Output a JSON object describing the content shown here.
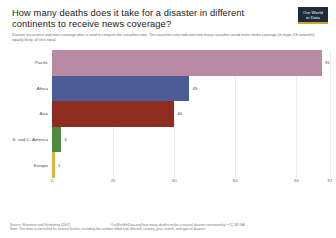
{
  "header": {
    "title": "How many deaths does it take for a disaster in different continents to receive news coverage?",
    "subtitle": "Disaster occurrence and news coverage data is used to compute the casualties ratio. The casualties ratio indicates how many casualties would make media coverage (in major US networks) equally likely, all else equal.",
    "logo_line1": "Our World",
    "logo_line2": "in Data"
  },
  "footer": {
    "source": "Source: Eisensee and Strömberg (2007)",
    "url": "OurWorldInData.org/how-many-deaths-make-a-natural-disaster-newsworthy/ • CC BY-SA",
    "note": "Note: This data is controlled for several factors, including the number killed and affected, country, year, month, and type of disaster."
  },
  "chart_data": {
    "type": "bar",
    "orientation": "horizontal",
    "title": "How many deaths does it take for a disaster in different continents to receive news coverage?",
    "xlabel": "",
    "ylabel": "",
    "xlim": [
      0,
      91
    ],
    "xticks": [
      "0",
      "20",
      "40",
      "60",
      "80",
      "91"
    ],
    "xtick_values": [
      0,
      20,
      40,
      60,
      80,
      91
    ],
    "grid": true,
    "legend": "none",
    "categories": [
      "Pacific",
      "Africa",
      "Asia",
      "S. and C. America",
      "Europe"
    ],
    "values": [
      91,
      45,
      40,
      3,
      1
    ],
    "colors": [
      "#b88aa3",
      "#4c5c96",
      "#8c2d20",
      "#4f8a3d",
      "#e0b43a"
    ],
    "bars": [
      {
        "label": "Pacific",
        "value": 91,
        "value_text": "91",
        "color": "#b88aa3"
      },
      {
        "label": "Africa",
        "value": 45,
        "value_text": "45",
        "color": "#4c5c96"
      },
      {
        "label": "Asia",
        "value": 40,
        "value_text": "40",
        "color": "#8c2d20"
      },
      {
        "label": "S. and C. America",
        "value": 3,
        "value_text": "3",
        "color": "#4f8a3d"
      },
      {
        "label": "Europe",
        "value": 1,
        "value_text": "1",
        "color": "#e0b43a"
      }
    ]
  }
}
